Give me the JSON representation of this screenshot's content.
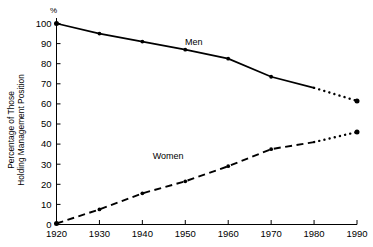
{
  "chart_data": {
    "type": "line",
    "title": "",
    "subtitle": "",
    "xlabel": "",
    "ylabel": "Percentage of Those Holding Management Position",
    "ylabel_lines": [
      "Percentage of Those",
      "Holding Management Position"
    ],
    "yunit": "%",
    "categories": [
      1920,
      1930,
      1940,
      1950,
      1960,
      1970,
      1980,
      1990
    ],
    "x": [
      1920,
      1930,
      1940,
      1950,
      1960,
      1970,
      1980,
      1990
    ],
    "xlim": [
      1920,
      1990
    ],
    "ylim": [
      0,
      100
    ],
    "xticks": [
      1920,
      1930,
      1940,
      1950,
      1960,
      1970,
      1980,
      1990
    ],
    "xtick_labels": [
      "1920",
      "1930",
      "1940",
      "1950",
      "1960",
      "1970",
      "1980",
      "1990"
    ],
    "yticks": [
      0,
      10,
      20,
      30,
      40,
      50,
      60,
      70,
      80,
      90,
      100
    ],
    "ytick_labels": [
      "0",
      "10",
      "20",
      "30",
      "40",
      "50",
      "60",
      "70",
      "80",
      "90",
      "100"
    ],
    "grid": false,
    "legend": "inline-annotations",
    "projection_starts_at": 1980,
    "series": [
      {
        "name": "Men",
        "label": "Men",
        "style": "solid",
        "projected_style": "dotted",
        "color": "#000000",
        "values": [
          100,
          95,
          91,
          87,
          82.5,
          73.5,
          68,
          61.5
        ],
        "markers_at": [
          1920,
          1930,
          1940,
          1950,
          1960,
          1970,
          1990
        ]
      },
      {
        "name": "Women",
        "label": "Women",
        "style": "dashed",
        "projected_style": "dotted",
        "color": "#000000",
        "values": [
          0.5,
          7.5,
          15.5,
          21.5,
          29,
          37.5,
          41,
          46
        ],
        "markers_at": [
          1920,
          1930,
          1940,
          1950,
          1960,
          1970,
          1990
        ]
      }
    ],
    "annotations": [
      {
        "text": "Men",
        "x": 1952,
        "y": 89.5
      },
      {
        "text": "Women",
        "x": 1946,
        "y": 32.5
      }
    ]
  }
}
